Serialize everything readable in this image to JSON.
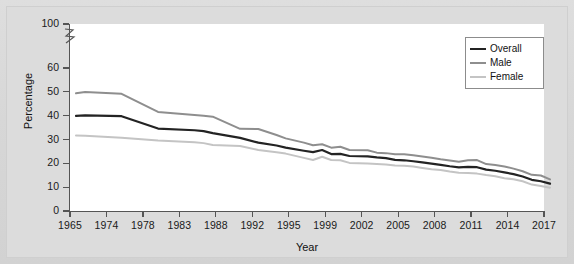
{
  "figure": {
    "background_color": "#d9d9d9",
    "plot_background_color": "#ffffff"
  },
  "axis_break": {
    "name": "y-axis-break",
    "between": [
      60,
      100
    ]
  },
  "legend": {
    "position": "top-right",
    "entries": [
      {
        "label": "Overall",
        "color": "#232323"
      },
      {
        "label": "Male",
        "color": "#8e8e8e"
      },
      {
        "label": "Female",
        "color": "#c4c4c4"
      }
    ]
  },
  "chart_data": {
    "type": "line",
    "title": "",
    "xlabel": "Year",
    "ylabel": "Percentage",
    "grid": false,
    "legend_position": "top-right",
    "ylim": [
      0,
      60
    ],
    "ytick_labels": [
      "0",
      "10",
      "20",
      "30",
      "40",
      "50",
      "60",
      "100"
    ],
    "ytick_values": [
      0,
      10,
      20,
      30,
      40,
      50,
      60,
      100
    ],
    "y_axis_break_between": [
      60,
      100
    ],
    "xtick_labels": [
      "1965",
      "1974",
      "1978",
      "1983",
      "1988",
      "1992",
      "1995",
      "1999",
      "2002",
      "2005",
      "2008",
      "2011",
      "2014",
      "2017"
    ],
    "x": [
      1965,
      1966,
      1970,
      1974,
      1978,
      1979,
      1980,
      1983,
      1985,
      1987,
      1988,
      1990,
      1991,
      1992,
      1993,
      1994,
      1995,
      1997,
      1998,
      1999,
      2000,
      2001,
      2002,
      2003,
      2004,
      2005,
      2006,
      2007,
      2008,
      2009,
      2010,
      2011,
      2012,
      2013,
      2014,
      2015,
      2016,
      2017
    ],
    "series": [
      {
        "name": "Overall",
        "color": "#232323",
        "values": [
          42.4,
          42.6,
          42.3,
          37.1,
          36.4,
          36.0,
          35.2,
          33.2,
          31.2,
          30.0,
          29.1,
          27.8,
          27.2,
          28.1,
          26.4,
          26.5,
          25.6,
          25.4,
          25.0,
          24.7,
          24.0,
          23.8,
          23.4,
          22.9,
          22.4,
          21.9,
          21.3,
          20.8,
          21.0,
          20.9,
          19.9,
          19.4,
          18.7,
          18.0,
          17.0,
          15.6,
          15.0,
          14.0
        ]
      },
      {
        "name": "Male",
        "color": "#8e8e8e",
        "values": [
          51.9,
          52.4,
          51.7,
          44.1,
          42.8,
          42.5,
          42.1,
          37.0,
          36.9,
          34.4,
          33.0,
          31.2,
          30.1,
          30.5,
          29.1,
          29.5,
          28.1,
          28.0,
          27.0,
          26.8,
          26.3,
          26.3,
          25.9,
          25.4,
          24.9,
          24.2,
          23.7,
          23.2,
          23.8,
          23.9,
          22.2,
          21.8,
          21.2,
          20.3,
          19.2,
          17.7,
          17.4,
          15.8
        ]
      },
      {
        "name": "Female",
        "color": "#c4c4c4",
        "values": [
          34.2,
          34.1,
          33.3,
          32.1,
          31.4,
          31.0,
          30.2,
          29.8,
          28.1,
          27.2,
          26.6,
          24.8,
          23.9,
          25.3,
          23.9,
          23.8,
          22.7,
          22.4,
          22.2,
          22.0,
          21.6,
          21.5,
          21.2,
          20.6,
          20.0,
          19.7,
          19.1,
          18.6,
          18.5,
          18.2,
          17.6,
          17.1,
          16.3,
          15.8,
          15.0,
          13.6,
          13.0,
          12.3
        ]
      }
    ]
  }
}
